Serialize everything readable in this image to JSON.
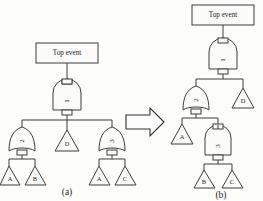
{
  "figure": {
    "type": "fault-tree-diagram",
    "panels": [
      {
        "id": "a",
        "caption": "(a)",
        "top_event_label": "Top event",
        "gates": [
          {
            "id": "g1",
            "label": "1",
            "type": "and"
          },
          {
            "id": "g2",
            "label": "2",
            "type": "or"
          },
          {
            "id": "g3",
            "label": "3",
            "type": "or"
          }
        ],
        "basic_events": [
          {
            "id": "a-d",
            "label": "D"
          },
          {
            "id": "a-a1",
            "label": "A"
          },
          {
            "id": "a-b",
            "label": "B"
          },
          {
            "id": "a-a2",
            "label": "A"
          },
          {
            "id": "a-c",
            "label": "C"
          }
        ]
      },
      {
        "id": "b",
        "caption": "(b)",
        "top_event_label": "Top event",
        "gates": [
          {
            "id": "g1",
            "label": "1",
            "type": "and"
          },
          {
            "id": "g2",
            "label": "2",
            "type": "or"
          },
          {
            "id": "g3",
            "label": "3",
            "type": "and"
          }
        ],
        "basic_events": [
          {
            "id": "b-d",
            "label": "D"
          },
          {
            "id": "b-a",
            "label": "A"
          },
          {
            "id": "b-b",
            "label": "B"
          },
          {
            "id": "b-c",
            "label": "C"
          }
        ]
      }
    ],
    "transform_arrow": {
      "label": "",
      "direction": "right"
    },
    "colors": {
      "line": "#3d3d3d",
      "background": "#fdfdfc",
      "text": "#1d1d1d"
    }
  }
}
